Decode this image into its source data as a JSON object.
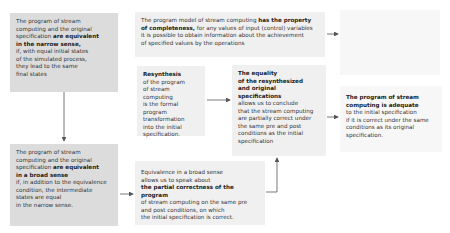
{
  "boxes": {
    "narrow": {
      "lines": [
        "The program of stream",
        "computing and the original",
        "specification"
      ],
      "bold_inline": "are equivalent",
      "bold_line": "in the narrow sense,",
      "rest": [
        "if, with equal initial states",
        "of the simulated process,",
        "they lead to the same",
        "final states"
      ]
    },
    "completeness": {
      "pre": "The program model of stream computing ",
      "bold1": "has the property",
      "bold2": "of completeness,",
      "post1": " for any values of input (control) variables",
      "line3": "it is possible to obtain information about the achievement",
      "line4": "of specified values by the operations"
    },
    "resynthesis": {
      "title": "Resynthesis",
      "lines": [
        "of the program",
        "of stream computing",
        "is the formal program",
        "transformation",
        "into the initial",
        "specification."
      ]
    },
    "equality": {
      "title_lines": [
        "The equality",
        "of the resynthesized",
        "and original specifications"
      ],
      "lines": [
        "allows us to conclude",
        "that the stream computing",
        "are partially correct under",
        "the same pre and post",
        "conditions as the initial",
        "specification"
      ]
    },
    "adequate": {
      "title_lines": [
        "The program of stream",
        "computing is adequate"
      ],
      "lines": [
        "to the initial specification",
        "if it is correct under the same",
        "conditions as its original",
        "specification."
      ]
    },
    "broad": {
      "lines": [
        "The program of stream",
        "computing and the original",
        "specification"
      ],
      "bold_inline": "are equivalent",
      "bold_line": "in a broad sense",
      "rest": [
        "if, in addition to the equivalence",
        "condition, the intermediate",
        "states are equal",
        "in the narrow sense."
      ]
    },
    "partial": {
      "lines": [
        "Equivalence in a broad sense",
        "allows us to speak about"
      ],
      "bold_line": "the partial correctness of the program",
      "rest": [
        "of stream computing on the same pre",
        "and post conditions, on which",
        "the initial specification is correct."
      ]
    }
  },
  "colors": {
    "dark": "#dcdcdc",
    "mid": "#e6e6e6",
    "light": "#f0f0f0",
    "faint": "#f7f7f7",
    "arrow": "#555555"
  }
}
